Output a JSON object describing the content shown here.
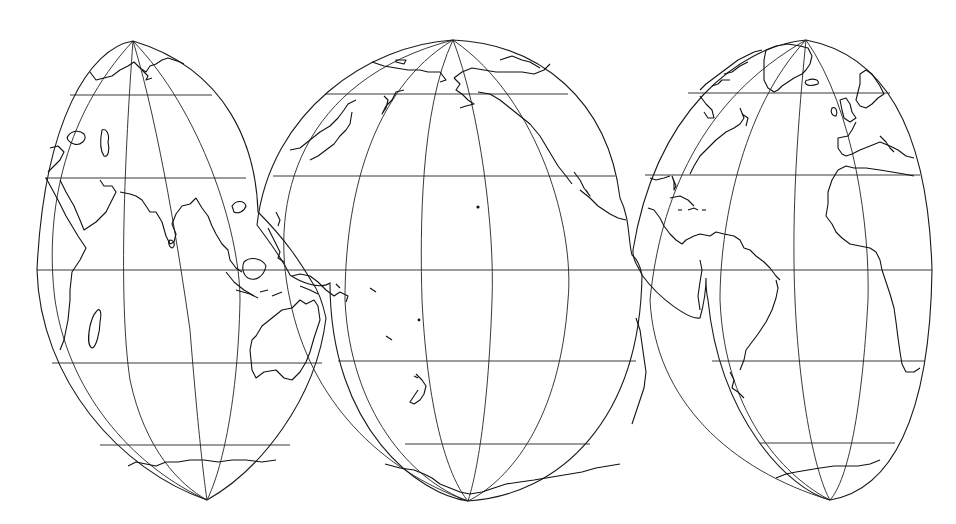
{
  "map": {
    "type": "interrupted-world-projection",
    "background": "#ffffff",
    "line_color": "#1a1a1a",
    "lobes": [
      {
        "id": "old-world",
        "name": "Europe-Africa-Asia-Indian Ocean lobe"
      },
      {
        "id": "pacific",
        "name": "Pacific Ocean lobe"
      },
      {
        "id": "atlantic",
        "name": "Americas-Atlantic lobe"
      }
    ],
    "graticule": {
      "parallels_y": [
        95,
        180,
        270,
        362,
        445
      ],
      "equator_y": 270
    },
    "features": [
      "Eurasia",
      "Africa",
      "Madagascar",
      "Arabian Peninsula",
      "India",
      "Southeast Asia",
      "Indonesia",
      "New Guinea",
      "Australia",
      "Japan",
      "Kamchatka",
      "Alaska",
      "North America",
      "Greenland",
      "Iceland",
      "British Isles",
      "Caribbean",
      "South America",
      "New Zealand",
      "Antarctica",
      "Hawaii"
    ]
  }
}
